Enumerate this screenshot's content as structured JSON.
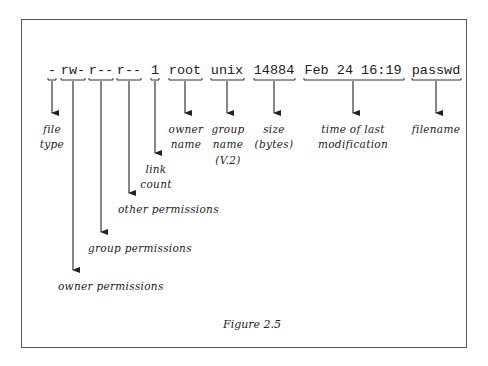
{
  "figure": {
    "caption": "Figure 2.5",
    "listing_fields": [
      {
        "id": "type",
        "text": "-",
        "x": 52
      },
      {
        "id": "owner_perm",
        "text": "rw-",
        "x": 73
      },
      {
        "id": "group_perm",
        "text": "r--",
        "x": 101
      },
      {
        "id": "other_perm",
        "text": "r--",
        "x": 129
      },
      {
        "id": "links",
        "text": "1",
        "x": 155
      },
      {
        "id": "owner",
        "text": "root",
        "x": 185
      },
      {
        "id": "group",
        "text": "unix",
        "x": 227
      },
      {
        "id": "size",
        "text": "14884",
        "x": 274
      },
      {
        "id": "mtime",
        "text": "Feb 24 16:19",
        "x": 353
      },
      {
        "id": "name",
        "text": "passwd",
        "x": 436
      }
    ],
    "labels": {
      "file_type": [
        "file",
        "type"
      ],
      "owner_name": [
        "owner",
        "name"
      ],
      "group_name": [
        "group",
        "name",
        "(V.2)"
      ],
      "size": [
        "size",
        "(bytes)"
      ],
      "time": [
        "time of last",
        "modification"
      ],
      "filename": [
        "filename"
      ],
      "link_count": [
        "link",
        "count"
      ],
      "other_permissions": [
        "other permissions"
      ],
      "group_permissions": [
        "group permissions"
      ],
      "owner_permissions": [
        "owner permissions"
      ]
    }
  }
}
